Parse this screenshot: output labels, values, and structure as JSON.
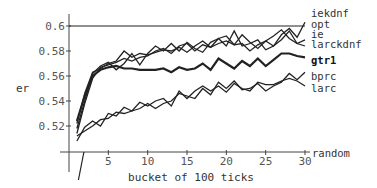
{
  "chart_data": {
    "type": "line",
    "title": "",
    "xlabel": "bucket of 100 ticks",
    "ylabel": "er",
    "xlim": [
      0,
      30
    ],
    "ylim": [
      0.505,
      0.61
    ],
    "x_ticks": [
      5,
      10,
      15,
      20,
      25,
      30
    ],
    "y_ticks": [
      0.52,
      0.54,
      0.56,
      0.58,
      0.6
    ],
    "x_tick_labels": [
      "5",
      "10",
      "15",
      "20",
      "25",
      "30"
    ],
    "y_tick_labels": [
      "0.52",
      "0.54",
      "0.56",
      "0.58",
      "0.6"
    ],
    "grid": false,
    "legend_position": "inline-right",
    "x": [
      1,
      2,
      3,
      4,
      5,
      6,
      7,
      8,
      9,
      10,
      11,
      12,
      13,
      14,
      15,
      16,
      17,
      18,
      19,
      20,
      21,
      22,
      23,
      24,
      25,
      26,
      27,
      28,
      29,
      30
    ],
    "series": [
      {
        "name": "iekdnf",
        "bold": false,
        "width": 1.3,
        "values": [
          0.522,
          0.546,
          0.563,
          0.566,
          0.57,
          0.572,
          0.58,
          0.575,
          0.578,
          0.577,
          0.579,
          0.581,
          0.58,
          0.583,
          0.579,
          0.584,
          0.588,
          0.583,
          0.59,
          0.584,
          0.596,
          0.584,
          0.586,
          0.589,
          0.581,
          0.584,
          0.593,
          0.598,
          0.591,
          0.603
        ]
      },
      {
        "name": "opt",
        "bold": false,
        "width": 1.2,
        "values": [
          0.6,
          0.6,
          0.6,
          0.6,
          0.6,
          0.6,
          0.6,
          0.6,
          0.6,
          0.6,
          0.6,
          0.6,
          0.6,
          0.6,
          0.6,
          0.6,
          0.6,
          0.6,
          0.6,
          0.6,
          0.6,
          0.6,
          0.6,
          0.6,
          0.6,
          0.6,
          0.6,
          0.6,
          0.6,
          0.6
        ]
      },
      {
        "name": "ie",
        "bold": false,
        "width": 1.3,
        "values": [
          0.518,
          0.54,
          0.562,
          0.568,
          0.571,
          0.565,
          0.57,
          0.578,
          0.569,
          0.578,
          0.584,
          0.58,
          0.586,
          0.58,
          0.587,
          0.582,
          0.579,
          0.587,
          0.59,
          0.592,
          0.585,
          0.593,
          0.587,
          0.582,
          0.588,
          0.592,
          0.597,
          0.59,
          0.586,
          0.589
        ]
      },
      {
        "name": "larckdnf",
        "bold": false,
        "width": 1.3,
        "values": [
          0.514,
          0.538,
          0.558,
          0.567,
          0.569,
          0.571,
          0.574,
          0.572,
          0.575,
          0.576,
          0.58,
          0.582,
          0.578,
          0.584,
          0.586,
          0.58,
          0.585,
          0.583,
          0.586,
          0.588,
          0.585,
          0.586,
          0.58,
          0.585,
          0.588,
          0.584,
          0.589,
          0.596,
          0.586,
          0.584
        ]
      },
      {
        "name": "gtr1",
        "bold": true,
        "width": 2.2,
        "values": [
          0.524,
          0.544,
          0.56,
          0.565,
          0.567,
          0.568,
          0.566,
          0.566,
          0.565,
          0.565,
          0.565,
          0.566,
          0.563,
          0.567,
          0.565,
          0.566,
          0.57,
          0.565,
          0.574,
          0.57,
          0.566,
          0.572,
          0.568,
          0.574,
          0.568,
          0.573,
          0.578,
          0.578,
          0.576,
          0.575
        ]
      },
      {
        "name": "bprc",
        "bold": false,
        "width": 1.3,
        "values": [
          0.512,
          0.516,
          0.52,
          0.525,
          0.526,
          0.531,
          0.53,
          0.532,
          0.534,
          0.538,
          0.534,
          0.538,
          0.54,
          0.546,
          0.544,
          0.542,
          0.55,
          0.545,
          0.555,
          0.55,
          0.556,
          0.549,
          0.55,
          0.554,
          0.548,
          0.552,
          0.555,
          0.562,
          0.557,
          0.563
        ]
      },
      {
        "name": "larc",
        "bold": false,
        "width": 1.3,
        "values": [
          0.508,
          0.519,
          0.524,
          0.52,
          0.53,
          0.528,
          0.535,
          0.532,
          0.539,
          0.536,
          0.54,
          0.542,
          0.536,
          0.548,
          0.542,
          0.548,
          0.552,
          0.548,
          0.552,
          0.547,
          0.554,
          0.55,
          0.548,
          0.555,
          0.553,
          0.553,
          0.556,
          0.558,
          0.556,
          0.552
        ]
      },
      {
        "name": "random",
        "bold": false,
        "width": 1.2,
        "values": [
          0.483,
          0.505,
          0.505,
          0.505,
          0.505,
          0.505,
          0.505,
          0.505,
          0.505,
          0.505,
          0.505,
          0.505,
          0.505,
          0.505,
          0.505,
          0.505,
          0.505,
          0.505,
          0.505,
          0.505,
          0.505,
          0.505,
          0.505,
          0.505,
          0.505,
          0.505,
          0.505,
          0.505,
          0.505,
          0.505
        ]
      }
    ]
  },
  "labels": {
    "ylabel": "er",
    "xlabel": "bucket of 100 ticks",
    "series": [
      {
        "text": "iekdnf",
        "y": 17,
        "bold": false
      },
      {
        "text": "opt",
        "y": 28,
        "bold": false
      },
      {
        "text": "ie",
        "y": 38,
        "bold": false
      },
      {
        "text": "larckdnf",
        "y": 48,
        "bold": false
      },
      {
        "text": "gtr1",
        "y": 64,
        "bold": true
      },
      {
        "text": "bprc",
        "y": 80,
        "bold": false
      },
      {
        "text": "larc",
        "y": 92,
        "bold": false
      },
      {
        "text": "random",
        "y": 157,
        "bold": false
      }
    ]
  }
}
